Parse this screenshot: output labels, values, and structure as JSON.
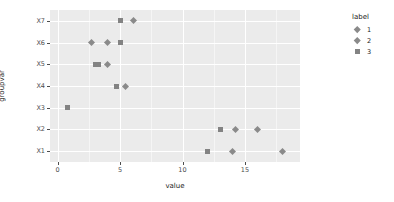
{
  "chart_data": {
    "type": "scatter",
    "title": "",
    "xlabel": "value",
    "ylabel": "groupvar",
    "xlim": [
      -0.6,
      19.4
    ],
    "ylim_categories": [
      "X1",
      "X2",
      "X3",
      "X4",
      "X5",
      "X6",
      "X7"
    ],
    "x_ticks": [
      0,
      5,
      10,
      15
    ],
    "x_tick_labels": [
      "0",
      "5",
      "10",
      "15"
    ],
    "y_tick_labels": [
      "X7",
      "X6",
      "X5",
      "X4",
      "X3",
      "X2",
      "X1"
    ],
    "grid": true,
    "legend": {
      "title": "label",
      "position": "right",
      "entries": [
        {
          "label": "1",
          "shape": "diamond",
          "color": "#8a8a8a"
        },
        {
          "label": "2",
          "shape": "diamond",
          "color": "#8a8a8a"
        },
        {
          "label": "3",
          "shape": "square",
          "color": "#838383"
        }
      ]
    },
    "points": [
      {
        "groupvar": "X7",
        "value": 5.0,
        "label": "3",
        "shape": "square"
      },
      {
        "groupvar": "X7",
        "value": 6.1,
        "label": "1",
        "shape": "diamond"
      },
      {
        "groupvar": "X6",
        "value": 2.7,
        "label": "1",
        "shape": "diamond"
      },
      {
        "groupvar": "X6",
        "value": 4.0,
        "label": "2",
        "shape": "diamond"
      },
      {
        "groupvar": "X6",
        "value": 5.0,
        "label": "3",
        "shape": "square"
      },
      {
        "groupvar": "X5",
        "value": 3.0,
        "label": "3",
        "shape": "square"
      },
      {
        "groupvar": "X5",
        "value": 3.3,
        "label": "2",
        "shape": "square"
      },
      {
        "groupvar": "X5",
        "value": 4.0,
        "label": "1",
        "shape": "diamond"
      },
      {
        "groupvar": "X4",
        "value": 4.7,
        "label": "3",
        "shape": "square"
      },
      {
        "groupvar": "X4",
        "value": 5.4,
        "label": "1",
        "shape": "diamond"
      },
      {
        "groupvar": "X3",
        "value": 0.8,
        "label": "2",
        "shape": "square"
      },
      {
        "groupvar": "X2",
        "value": 13.0,
        "label": "3",
        "shape": "square"
      },
      {
        "groupvar": "X2",
        "value": 14.2,
        "label": "2",
        "shape": "diamond"
      },
      {
        "groupvar": "X2",
        "value": 16.0,
        "label": "1",
        "shape": "diamond"
      },
      {
        "groupvar": "X1",
        "value": 12.0,
        "label": "3",
        "shape": "square"
      },
      {
        "groupvar": "X1",
        "value": 14.0,
        "label": "2",
        "shape": "diamond"
      },
      {
        "groupvar": "X1",
        "value": 18.0,
        "label": "1",
        "shape": "diamond"
      }
    ]
  }
}
